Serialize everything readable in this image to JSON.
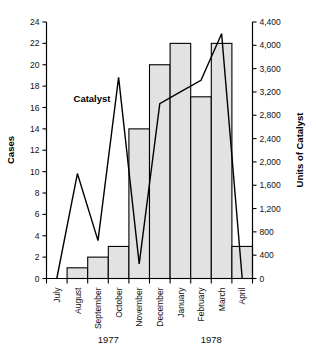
{
  "chart_data": {
    "type": "bar",
    "title": "",
    "subtitle": "",
    "xlabel": "",
    "ylabel": "Cases",
    "y2label": "Units of Catalyst",
    "grid": false,
    "legend_position": "inline-annotation",
    "categories": [
      "July",
      "August",
      "September",
      "October",
      "November",
      "December",
      "January",
      "February",
      "March",
      "April"
    ],
    "group_labels": [
      {
        "label": "1977",
        "from": "July",
        "to": "December"
      },
      {
        "label": "1978",
        "from": "January",
        "to": "April"
      }
    ],
    "ylim": [
      0,
      24
    ],
    "y_ticks": [
      0,
      2,
      4,
      6,
      8,
      10,
      12,
      14,
      16,
      18,
      20,
      22,
      24
    ],
    "y_tick_labels": [
      "0",
      "2",
      "4",
      "6",
      "8",
      "10",
      "12",
      "14",
      "16",
      "18",
      "20",
      "22",
      "24"
    ],
    "y2lim": [
      0,
      4400
    ],
    "y2_ticks": [
      0,
      400,
      800,
      1200,
      1600,
      2000,
      2400,
      2800,
      3200,
      3600,
      4000,
      4400
    ],
    "y2_tick_labels": [
      "0",
      "400",
      "800",
      "1,200",
      "1,600",
      "2,000",
      "2,400",
      "2,800",
      "3,200",
      "3,600",
      "4,000",
      "4,400"
    ],
    "series": [
      {
        "name": "Cases",
        "type": "bar",
        "axis": "left",
        "fill_color": "#e2e2e2",
        "edge_color": "#000000",
        "values": [
          0,
          1,
          2,
          3,
          14,
          20,
          22,
          17,
          22,
          3
        ]
      },
      {
        "name": "Catalyst",
        "type": "line",
        "axis": "right",
        "line_color": "#000000",
        "annotation": "Catalyst",
        "values": [
          0,
          1800,
          650,
          3450,
          250,
          3000,
          3200,
          3400,
          4200,
          0
        ],
        "values_on_left_scale": [
          0.0,
          9.0,
          3.3,
          17.5,
          1.3,
          16.0,
          16.4,
          17.1,
          21.2,
          0.0
        ]
      }
    ]
  },
  "annotations": {
    "catalyst_label": "Catalyst"
  }
}
